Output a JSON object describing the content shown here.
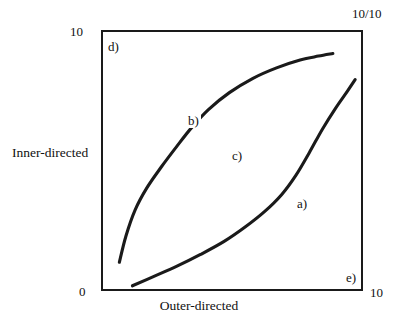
{
  "figure": {
    "type": "line-diagram",
    "background_color": "#ffffff",
    "ink_color": "#1a1a1a"
  },
  "axes": {
    "x_title": "Outer-directed",
    "y_title": "Inner-directed",
    "y_max_label": "10",
    "y_min_label": "0",
    "x_max_label": "10",
    "corner_ratio_label": "10/10",
    "x_range": [
      0,
      10
    ],
    "y_range": [
      0,
      10
    ],
    "grid_divisions_x": 10,
    "grid_divisions_y": 10,
    "grid": true
  },
  "plot_labels": {
    "a": "a)",
    "b": "b)",
    "c": "c)",
    "d": "d)",
    "e": "e)"
  },
  "chart_data": {
    "type": "line",
    "title": "",
    "xlabel": "Outer-directed",
    "ylabel": "Inner-directed",
    "xlim": [
      0,
      10
    ],
    "ylim": [
      0,
      10
    ],
    "grid": true,
    "legend": "none",
    "annotations": [
      {
        "text": "a)",
        "x": 7.5,
        "y": 3.9,
        "note": "label on lower-right convex curve"
      },
      {
        "text": "b)",
        "x": 3.4,
        "y": 6.3,
        "note": "label on upper-left concave curve"
      },
      {
        "text": "c)",
        "x": 5.1,
        "y": 5.1,
        "note": "centre reference label on mid gridline"
      },
      {
        "text": "d)",
        "x": 0.3,
        "y": 9.5,
        "note": "upper-left region label"
      },
      {
        "text": "e)",
        "x": 9.4,
        "y": 0.6,
        "note": "lower-right region label"
      }
    ],
    "series": [
      {
        "name": "b",
        "label": "b)",
        "description": "upper-left concave curve rising steeply then flattening",
        "x": [
          0.7,
          0.95,
          1.3,
          1.75,
          2.3,
          2.9,
          3.45,
          4.1,
          4.9,
          5.8,
          6.7,
          7.6,
          8.3,
          8.85
        ],
        "y": [
          1.1,
          2.1,
          3.1,
          3.95,
          4.75,
          5.55,
          6.25,
          6.95,
          7.6,
          8.15,
          8.55,
          8.85,
          9.0,
          9.1
        ]
      },
      {
        "name": "a",
        "label": "a)",
        "description": "lower-right convex curve rising slowly then steeply",
        "x": [
          1.2,
          2.0,
          2.9,
          3.8,
          4.7,
          5.5,
          6.25,
          6.9,
          7.45,
          7.95,
          8.45,
          8.95,
          9.4,
          9.7
        ],
        "y": [
          0.2,
          0.55,
          0.95,
          1.4,
          1.9,
          2.45,
          3.05,
          3.7,
          4.45,
          5.3,
          6.2,
          7.0,
          7.65,
          8.1
        ]
      }
    ]
  }
}
